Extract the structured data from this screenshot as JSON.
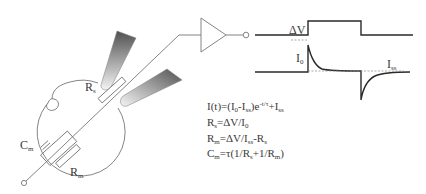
{
  "diagram": {
    "cell_labels": {
      "rs": "R",
      "rs_sub": "s",
      "cm": "C",
      "cm_sub": "m",
      "rm": "R",
      "rm_sub": "m"
    },
    "waveform_labels": {
      "delta_v": "ΔV",
      "i0": "I",
      "i0_sub": "0",
      "iss": "I",
      "iss_sub": "ss"
    },
    "equations": [
      {
        "text": "I(t)=(I0-Iss)e-t/τ+Iss"
      },
      {
        "text": "Rs=ΔV/I0"
      },
      {
        "text": "Rm=ΔV/Iss-Rs"
      },
      {
        "text": "Cm=τ(1/Rs+1/Rm)"
      }
    ],
    "eq_parts": {
      "e1": {
        "a": "I(t)=(I",
        "b": "0",
        "c": "-I",
        "d": "ss",
        "e": ")e",
        "f": "-t/τ",
        "g": "+I",
        "h": "ss"
      },
      "e2": {
        "a": "R",
        "b": "s",
        "c": "=ΔV/I",
        "d": "0"
      },
      "e3": {
        "a": "R",
        "b": "m",
        "c": "=ΔV/I",
        "d": "ss",
        "e": "-R",
        "f": "s"
      },
      "e4": {
        "a": "C",
        "b": "m",
        "c": "=τ(1/R",
        "d": "s",
        "e": "+1/R",
        "f": "m",
        "g": ")"
      }
    },
    "colors": {
      "line": "#666666",
      "trace": "#333333",
      "pipette_dark": "#555555",
      "pipette_light": "#f2f2f2"
    }
  }
}
